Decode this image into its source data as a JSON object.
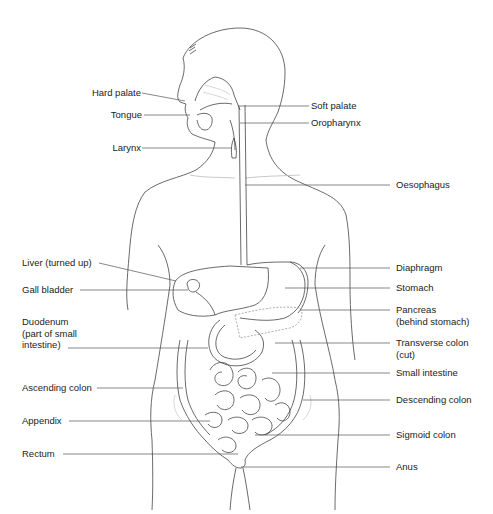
{
  "diagram": {
    "line_color": "#444444",
    "text_color": "#222222",
    "background": "#ffffff",
    "labels_left": [
      {
        "id": "hard-palate",
        "text": "Hard palate"
      },
      {
        "id": "tongue",
        "text": "Tongue"
      },
      {
        "id": "larynx",
        "text": "Larynx"
      },
      {
        "id": "liver",
        "text": "Liver (turned up)"
      },
      {
        "id": "gall-bladder",
        "text": "Gall bladder"
      },
      {
        "id": "duodenum",
        "lines": [
          "Duodenum",
          "(part of small",
          "intestine)"
        ]
      },
      {
        "id": "ascending-colon",
        "text": "Ascending colon"
      },
      {
        "id": "appendix",
        "text": "Appendix"
      },
      {
        "id": "rectum",
        "text": "Rectum"
      }
    ],
    "labels_right": [
      {
        "id": "soft-palate",
        "text": "Soft palate"
      },
      {
        "id": "oropharynx",
        "text": "Oropharynx"
      },
      {
        "id": "oesophagus",
        "text": "Oesophagus"
      },
      {
        "id": "diaphragm",
        "text": "Diaphragm"
      },
      {
        "id": "stomach",
        "text": "Stomach"
      },
      {
        "id": "pancreas",
        "lines": [
          "Pancreas",
          "(behind stomach)"
        ]
      },
      {
        "id": "transverse-colon",
        "lines": [
          "Transverse colon",
          "(cut)"
        ]
      },
      {
        "id": "small-intestine",
        "text": "Small intestine"
      },
      {
        "id": "descending-colon",
        "text": "Descending colon"
      },
      {
        "id": "sigmoid-colon",
        "text": "Sigmoid colon"
      },
      {
        "id": "anus",
        "text": "Anus"
      }
    ]
  }
}
